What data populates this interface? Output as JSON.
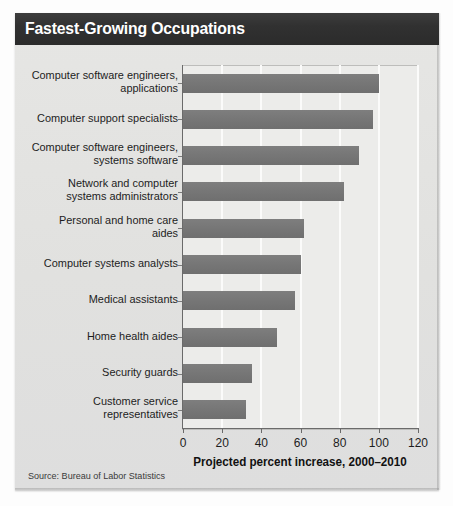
{
  "figure": {
    "title": "Fastest-Growing Occupations",
    "source": "Source: Bureau of Labor Statistics",
    "colors": {
      "header_bar": "#313131",
      "header_text": "#ffffff",
      "card_background": "#e3e3e1",
      "plot_background": "#ececea",
      "bar_fill": "#767676",
      "gridline": "#fbfbfa",
      "axis_line": "#6a6a6a",
      "text": "#1d1d1d"
    }
  },
  "chart_data": {
    "type": "bar",
    "orientation": "horizontal",
    "title": "Fastest-Growing Occupations",
    "xlabel": "Projected percent increase, 2000–2010",
    "ylabel": "",
    "xlim": [
      0,
      120
    ],
    "xticks": [
      0,
      20,
      40,
      60,
      80,
      100,
      120
    ],
    "xtick_labels": [
      "0",
      "20",
      "40",
      "60",
      "80",
      "100",
      "120"
    ],
    "grid": "vertical",
    "legend": "none",
    "categories": [
      "Computer software engineers,\napplications",
      "Computer support specialists",
      "Computer software engineers,\nsystems software",
      "Network and computer\nsystems administrators",
      "Personal and home care\naides",
      "Computer systems analysts",
      "Medical assistants",
      "Home health aides",
      "Security guards",
      "Customer service\nrepresentatives"
    ],
    "values": [
      100,
      97,
      90,
      82,
      62,
      60,
      57,
      48,
      35,
      32
    ],
    "units": "percent"
  }
}
